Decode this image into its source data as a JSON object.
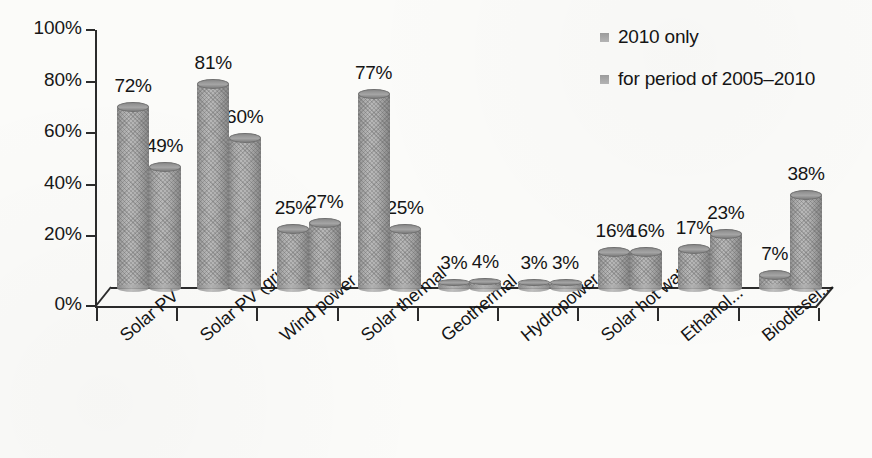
{
  "chart_data": {
    "type": "bar",
    "title": "",
    "subtitle": "",
    "xlabel": "",
    "ylabel": "",
    "ylim": [
      0,
      100
    ],
    "grid": false,
    "legend_position": "top-right",
    "value_suffix": "%",
    "categories": [
      "Solar PV",
      "Solar PV (grid)",
      "Wind power",
      "Solar thermal",
      "Geothermal",
      "Hydropower",
      "Solar hot water",
      "Ethanol...",
      "Biodiesel..."
    ],
    "y_ticks": [
      "0%",
      "20%",
      "40%",
      "60%",
      "80%",
      "100%"
    ],
    "y_tick_values": [
      0,
      20,
      40,
      60,
      80,
      100
    ],
    "series": [
      {
        "name": "2010 only",
        "values": [
          72,
          81,
          25,
          77,
          3,
          3,
          16,
          17,
          7
        ],
        "labels": [
          "72%",
          "81%",
          "25%",
          "77%",
          "3%",
          "3%",
          "16%",
          "17%",
          "7%"
        ],
        "color": "#a8a8a8"
      },
      {
        "name": "for period of 2005–2010",
        "values": [
          49,
          60,
          27,
          25,
          4,
          3,
          16,
          23,
          38
        ],
        "labels": [
          "49%",
          "60%",
          "27%",
          "25%",
          "4%",
          "3%",
          "16%",
          "23%",
          "38%"
        ],
        "color": "#a8a8a8"
      }
    ]
  },
  "legend": {
    "items": [
      {
        "label": "2010 only"
      },
      {
        "label": "for period of 2005–2010"
      }
    ]
  },
  "colors": {
    "background": "#fbfbf9",
    "axis": "#2b2b2b",
    "text": "#151515",
    "bar_fill": "#a8a8a8",
    "bar_edge": "#6f6f6f"
  }
}
